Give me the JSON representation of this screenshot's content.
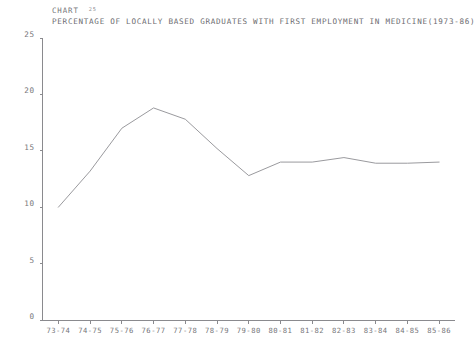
{
  "header": {
    "caption_word": "CHART",
    "caption_number": "25",
    "title": "PERCENTAGE OF LOCALLY BASED GRADUATES WITH FIRST EMPLOYMENT IN MEDICINE(1973-86)"
  },
  "colors": {
    "ink": "#6f6f72",
    "axis": "#8a8a8e",
    "line": "#9a9a9e",
    "background": "#ffffff"
  },
  "chart_data": {
    "type": "line",
    "title": "PERCENTAGE OF LOCALLY BASED GRADUATES WITH FIRST EMPLOYMENT IN MEDICINE(1973-86)",
    "xlabel": "",
    "ylabel": "",
    "categories": [
      "73-74",
      "74-75",
      "75-76",
      "76-77",
      "77-78",
      "78-79",
      "79-80",
      "80-81",
      "81-82",
      "82-83",
      "83-84",
      "84-85",
      "85-86"
    ],
    "values": [
      10.0,
      13.2,
      17.0,
      18.8,
      17.8,
      15.2,
      12.8,
      14.0,
      14.0,
      14.4,
      13.9,
      13.9,
      14.0
    ],
    "ylim": [
      0,
      25
    ],
    "yticks": [
      0,
      5,
      10,
      15,
      20,
      25
    ],
    "ytick_labels": [
      "0",
      "5",
      "10",
      "15",
      "20",
      "25"
    ],
    "grid": false,
    "legend": false,
    "legend_position": "none",
    "markers": false
  }
}
